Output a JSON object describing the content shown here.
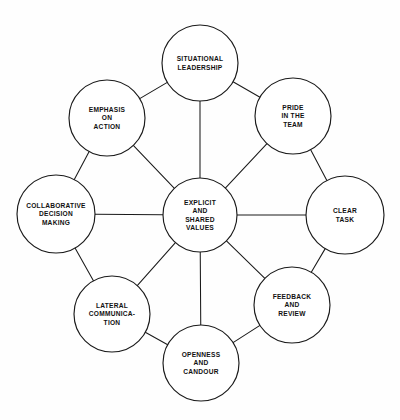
{
  "diagram": {
    "type": "hub-and-spoke-circle-diagram",
    "background_color": "#fefefe",
    "line_color": "#1a1a1a",
    "node_fill_color": "#ffffff",
    "center": {
      "id": "explicit-and-shared-values",
      "lines": [
        "EXPLICIT",
        "AND",
        "SHARED",
        "VALUES"
      ],
      "cx": 200,
      "cy": 215,
      "r": 37
    },
    "nodes": [
      {
        "id": "situational-leadership",
        "lines": [
          "SITUATIONAL",
          "LEADERSHIP"
        ],
        "cx": 200,
        "cy": 63,
        "r": 38
      },
      {
        "id": "pride-in-the-team",
        "lines": [
          "PRIDE",
          "IN THE",
          "TEAM"
        ],
        "cx": 293,
        "cy": 116,
        "r": 38
      },
      {
        "id": "clear-task",
        "lines": [
          "CLEAR",
          "TASK"
        ],
        "cx": 345,
        "cy": 215,
        "r": 39
      },
      {
        "id": "feedback-and-review",
        "lines": [
          "FEEDBACK",
          "AND",
          "REVIEW"
        ],
        "cx": 292,
        "cy": 305,
        "r": 38
      },
      {
        "id": "openness-and-candour",
        "lines": [
          "OPENNESS",
          "AND",
          "CANDOUR"
        ],
        "cx": 201,
        "cy": 363,
        "r": 38
      },
      {
        "id": "lateral-communication",
        "lines": [
          "LATERAL",
          "COMMUNICA-",
          "TION"
        ],
        "cx": 112,
        "cy": 314,
        "r": 38
      },
      {
        "id": "collaborative-decision-making",
        "lines": [
          "COLLABORATIVE",
          "DECISION",
          "MAKING"
        ],
        "cx": 56,
        "cy": 214,
        "r": 39
      },
      {
        "id": "emphasis-on-action",
        "lines": [
          "EMPHASIS",
          "ON",
          "ACTION"
        ],
        "cx": 107,
        "cy": 118,
        "r": 38
      }
    ],
    "edges": {
      "spokes_to_center": [
        "situational-leadership",
        "pride-in-the-team",
        "clear-task",
        "feedback-and-review",
        "openness-and-candour",
        "lateral-communication",
        "collaborative-decision-making",
        "emphasis-on-action"
      ],
      "ring": [
        [
          "situational-leadership",
          "pride-in-the-team"
        ],
        [
          "pride-in-the-team",
          "clear-task"
        ],
        [
          "clear-task",
          "feedback-and-review"
        ],
        [
          "feedback-and-review",
          "openness-and-candour"
        ],
        [
          "openness-and-candour",
          "lateral-communication"
        ],
        [
          "lateral-communication",
          "collaborative-decision-making"
        ],
        [
          "collaborative-decision-making",
          "emphasis-on-action"
        ],
        [
          "emphasis-on-action",
          "situational-leadership"
        ]
      ]
    }
  }
}
